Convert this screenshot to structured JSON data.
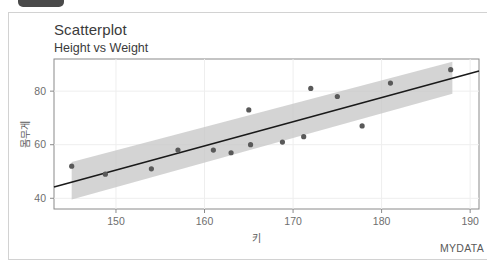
{
  "window": {
    "tab_label": ""
  },
  "chart_data": {
    "type": "scatter",
    "title": "Scatterplot",
    "subtitle": "Height vs Weight",
    "caption": "MYDATA",
    "xlabel": "키",
    "ylabel": "몸무게",
    "xlim": [
      143,
      191
    ],
    "ylim": [
      36,
      92
    ],
    "xticks": [
      150,
      160,
      170,
      180,
      190
    ],
    "xtick_labels": [
      "150",
      "160",
      "170",
      "180",
      "190"
    ],
    "yticks": [
      40,
      60,
      80
    ],
    "ytick_labels": [
      "40",
      "60",
      "80"
    ],
    "grid": true,
    "legend": "none",
    "point_color": "#595959",
    "line_color": "#1a1a1a",
    "band_color": "#c6c6c6",
    "points": [
      {
        "x": 145.0,
        "y": 52.0
      },
      {
        "x": 148.8,
        "y": 49.0
      },
      {
        "x": 154.0,
        "y": 51.0
      },
      {
        "x": 157.0,
        "y": 58.0
      },
      {
        "x": 161.0,
        "y": 58.0
      },
      {
        "x": 163.0,
        "y": 57.0
      },
      {
        "x": 165.0,
        "y": 73.0
      },
      {
        "x": 165.2,
        "y": 60.0
      },
      {
        "x": 168.8,
        "y": 61.0
      },
      {
        "x": 171.2,
        "y": 63.0
      },
      {
        "x": 172.0,
        "y": 81.0
      },
      {
        "x": 175.0,
        "y": 78.0
      },
      {
        "x": 177.8,
        "y": 67.0
      },
      {
        "x": 181.0,
        "y": 83.0
      },
      {
        "x": 187.8,
        "y": 88.0
      }
    ],
    "fit_line": {
      "x_start": 143.0,
      "y_start": 44.2,
      "x_end": 191.0,
      "y_end": 87.5,
      "label": "linear-regression-line"
    },
    "confidence_band": {
      "x_start": 145.0,
      "x_end": 188.0,
      "upper_start": 53.5,
      "lower_start": 39.5,
      "upper_end": 91.0,
      "lower_end": 79.0,
      "label": "confidence-interval-band"
    }
  }
}
